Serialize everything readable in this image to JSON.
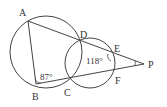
{
  "diagram": {
    "type": "geometry",
    "points": {
      "A": {
        "label": "A",
        "x": 28,
        "y": 21
      },
      "B": {
        "label": "B",
        "x": 36,
        "y": 84
      },
      "C": {
        "label": "C",
        "x": 69,
        "y": 81
      },
      "D": {
        "label": "D",
        "x": 81,
        "y": 41
      },
      "E": {
        "label": "E",
        "x": 114,
        "y": 56
      },
      "F": {
        "label": "F",
        "x": 114,
        "y": 70
      },
      "P": {
        "label": "P",
        "x": 144,
        "y": 64
      }
    },
    "circles": [
      {
        "name": "large-circle",
        "through": [
          "A",
          "B",
          "C",
          "D"
        ]
      },
      {
        "name": "small-circle",
        "through": [
          "D",
          "C",
          "E",
          "F"
        ]
      }
    ],
    "segments": [
      "AB",
      "BC",
      "AP",
      "BP"
    ],
    "angles": {
      "B": {
        "value": "87°",
        "vertex": "B"
      },
      "E": {
        "value": "118°",
        "vertex": "E"
      },
      "P": {
        "marked": true
      }
    }
  }
}
